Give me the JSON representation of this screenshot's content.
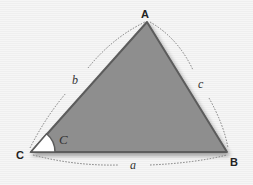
{
  "diagram": {
    "type": "triangle",
    "vertices": {
      "A": {
        "label": "A",
        "x": 147,
        "y": 22
      },
      "B": {
        "label": "B",
        "x": 227,
        "y": 152
      },
      "C": {
        "label": "C",
        "x": 31,
        "y": 152
      }
    },
    "sides": {
      "a": {
        "label": "a",
        "between": "C-B"
      },
      "b": {
        "label": "b",
        "between": "C-A"
      },
      "c": {
        "label": "c",
        "between": "A-B"
      }
    },
    "angle": {
      "label": "C",
      "at": "C",
      "fill": "#ffffff"
    },
    "colors": {
      "triangle_fill": "#8e8e8e",
      "triangle_edge": "#5c5c5c",
      "dashed_arc": "#7a7a7a",
      "background": "#f4f4f4"
    }
  }
}
